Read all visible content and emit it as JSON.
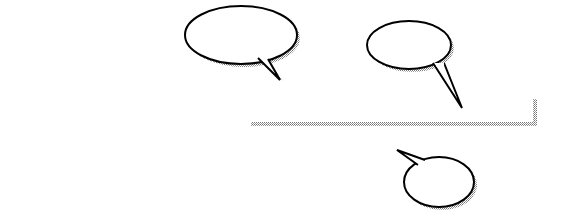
{
  "figure": {
    "subtitle": "Array Characteristics"
  },
  "array": {
    "name": "list",
    "indices": [
      "1",
      "2",
      "3",
      "4",
      "5",
      "6",
      "7",
      "8",
      "9",
      "10",
      "11"
    ],
    "values": [
      "",
      "",
      "",
      "",
      "",
      "",
      "",
      "",
      "23",
      "",
      ""
    ]
  },
  "callouts": {
    "subscript": [
      "Each array",
      "element is identified",
      "by a unique",
      "subscript"
    ],
    "value": [
      "Each element",
      "can store a",
      "single value"
    ],
    "name": [
      "The array",
      "has a",
      "name"
    ]
  }
}
